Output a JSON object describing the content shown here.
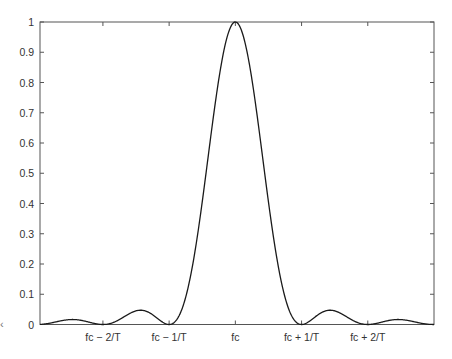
{
  "chart_data": {
    "type": "line",
    "title": "",
    "xlabel": "",
    "ylabel": "",
    "x_units": "multiples of 1/T relative to fc",
    "xlim": [
      -2.95,
      3.0
    ],
    "ylim": [
      0,
      1
    ],
    "grid": false,
    "legend": null,
    "x_ticks": [
      {
        "value": -2,
        "label": "fc − 2/T"
      },
      {
        "value": -1,
        "label": "fc − 1/T"
      },
      {
        "value": 0,
        "label": "fc"
      },
      {
        "value": 1,
        "label": "fc + 1/T"
      },
      {
        "value": 2,
        "label": "fc + 2/T"
      }
    ],
    "y_ticks": [
      {
        "value": 0,
        "label": "0"
      },
      {
        "value": 0.1,
        "label": "0.1"
      },
      {
        "value": 0.2,
        "label": "0.2"
      },
      {
        "value": 0.3,
        "label": "0.3"
      },
      {
        "value": 0.4,
        "label": "0.4"
      },
      {
        "value": 0.5,
        "label": "0.5"
      },
      {
        "value": 0.6,
        "label": "0.6"
      },
      {
        "value": 0.7,
        "label": "0.7"
      },
      {
        "value": 0.8,
        "label": "0.8"
      },
      {
        "value": 0.9,
        "label": "0.9"
      },
      {
        "value": 1,
        "label": "1"
      }
    ],
    "series": [
      {
        "name": "sinc^2((f - fc)T)",
        "color": "#1a1a1a",
        "x": [
          -2.95,
          -2.5,
          -2.0,
          -1.5,
          -1.0,
          -0.5,
          0.0,
          0.5,
          1.0,
          1.5,
          2.0,
          2.5,
          3.0
        ],
        "values": [
          0.0003,
          0.016,
          0.0,
          0.045,
          0.0,
          0.405,
          1.0,
          0.405,
          0.0,
          0.045,
          0.0,
          0.016,
          0.0
        ]
      }
    ],
    "key_points": {
      "main_lobe_peak": {
        "x": 0,
        "y": 1.0
      },
      "first_sidelobe_peak": {
        "x": 1.43,
        "y": 0.047
      },
      "second_sidelobe_peak": {
        "x": 2.46,
        "y": 0.016
      },
      "nulls": [
        -2,
        -1,
        1,
        2,
        3
      ]
    }
  },
  "stray_glyph": "‹"
}
